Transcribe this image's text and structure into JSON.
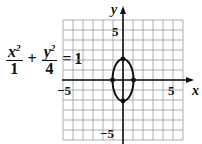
{
  "equation": {
    "term1_num": "x",
    "term1_exp": "2",
    "term1_den": "1",
    "op": "+",
    "term2_num": "y",
    "term2_exp": "2",
    "term2_den": "4",
    "equals": "=",
    "rhs": "1"
  },
  "axes": {
    "x_label": "x",
    "y_label": "y",
    "x_tick_neg": "−5",
    "x_tick_pos": "5",
    "y_tick_pos": "5",
    "y_tick_neg": "−5"
  },
  "chart_data": {
    "type": "line",
    "xlabel": "x",
    "ylabel": "y",
    "xlim": [
      -6,
      6
    ],
    "ylim": [
      -6,
      6
    ],
    "grid": true,
    "tick_labels": {
      "x": [
        -5,
        5
      ],
      "y": [
        -5,
        5
      ]
    },
    "series": [
      {
        "name": "ellipse",
        "shape": "ellipse",
        "center": [
          0,
          0
        ],
        "semi_axis_x": 1,
        "semi_axis_y": 2
      }
    ],
    "points": [
      {
        "x": -1,
        "y": 0
      },
      {
        "x": 1,
        "y": 0
      },
      {
        "x": 0,
        "y": 2
      },
      {
        "x": 0,
        "y": -2
      }
    ]
  }
}
